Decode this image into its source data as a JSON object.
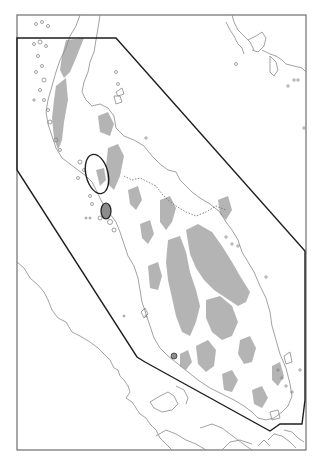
{
  "map": {
    "width": 322,
    "height": 468,
    "colors": {
      "background": "#ffffff",
      "frame": "#6e6e6e",
      "coastline": "#8a8a8a",
      "highland_fill": "#b4b4b4",
      "study_boundary": "#1e1e1e",
      "marker_fill": "#8c8c8c"
    },
    "frame": {
      "x": 17,
      "y": 15,
      "width": 289,
      "height": 435
    },
    "study_area_polygon": [
      [
        17,
        38
      ],
      [
        116,
        38
      ],
      [
        305,
        251
      ],
      [
        305,
        400
      ],
      [
        302,
        424
      ],
      [
        280,
        424
      ],
      [
        270,
        431
      ],
      [
        145,
        362
      ],
      [
        137,
        357
      ],
      [
        17,
        170
      ]
    ],
    "markers": [
      {
        "name": "outlined-area",
        "type": "outline",
        "cx": 97,
        "cy": 174,
        "rx": 11,
        "ry": 20
      },
      {
        "name": "filled-area",
        "type": "filled",
        "cx": 106,
        "cy": 211,
        "rx": 5,
        "ry": 8
      }
    ],
    "labels": []
  }
}
